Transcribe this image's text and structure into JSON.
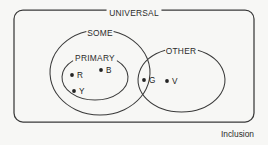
{
  "diagram": {
    "caption": "Inclusion",
    "universal": {
      "label": "UNIVERSAL",
      "x": 14,
      "y": 10,
      "width": 240,
      "height": 112,
      "corner_radius": 9,
      "label_center_x": 134,
      "label_y": 13
    },
    "sets": [
      {
        "name": "some-set",
        "label": "SOME",
        "cx": 100,
        "cy": 72.5,
        "rx": 50,
        "ry": 42.5,
        "label_x": 100,
        "label_y": 33
      },
      {
        "name": "primary-set",
        "label": "PRIMARY",
        "cx": 95,
        "cy": 77.5,
        "rx": 33,
        "ry": 22.5,
        "label_x": 95,
        "label_y": 58
      },
      {
        "name": "other-set",
        "label": "OTHER",
        "cx": 181.5,
        "cy": 80,
        "rx": 43.5,
        "ry": 32,
        "label_x": 181,
        "label_y": 51
      }
    ],
    "points": [
      {
        "name": "point-r",
        "label": "R",
        "cx": 72,
        "cy": 75,
        "label_x": 77,
        "label_y": 78,
        "region": "primary"
      },
      {
        "name": "point-b",
        "label": "B",
        "cx": 101,
        "cy": 70,
        "label_x": 106,
        "label_y": 73,
        "region": "primary"
      },
      {
        "name": "point-y",
        "label": "Y",
        "cx": 74,
        "cy": 91,
        "label_x": 79,
        "label_y": 94,
        "region": "primary"
      },
      {
        "name": "point-g",
        "label": "G",
        "cx": 144,
        "cy": 80,
        "label_x": 149,
        "label_y": 83,
        "region": "some-other-intersection"
      },
      {
        "name": "point-v",
        "label": "V",
        "cx": 167,
        "cy": 81,
        "label_x": 172,
        "label_y": 84,
        "region": "other"
      }
    ],
    "colors": {
      "stroke": "#3a3a3a",
      "text": "#2b2b2b",
      "point": "#232323",
      "background": "#f7f7f5"
    }
  }
}
